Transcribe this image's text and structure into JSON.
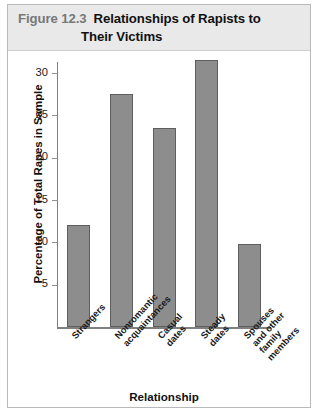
{
  "caption": {
    "number": "Figure 12.3",
    "title_line1": "Relationships of Rapists to",
    "title_line2": "Their Victims"
  },
  "chart_data": {
    "type": "bar",
    "title": "Relationships of Rapists to Their Victims",
    "xlabel": "Relationship",
    "ylabel": "Percentage of Total Rapes in Sample",
    "categories": [
      "Strangers",
      "Nonromantic\nacquaintances",
      "Casual\ndates",
      "Steady\ndates",
      "Spouses\nand other\nfamily\nmembers"
    ],
    "values": [
      12.0,
      27.5,
      23.5,
      31.5,
      9.8
    ],
    "ylim": [
      0,
      32.5
    ],
    "yticks": [
      5,
      10,
      15,
      20,
      25,
      30
    ],
    "ytick_labels": [
      "5",
      "10",
      "15",
      "20",
      "25",
      "30"
    ],
    "grid": false,
    "legend": false,
    "bar_color": "#8d8d8d",
    "bar_edge_color": "#5e5e5e",
    "axis_color": "#808080"
  }
}
